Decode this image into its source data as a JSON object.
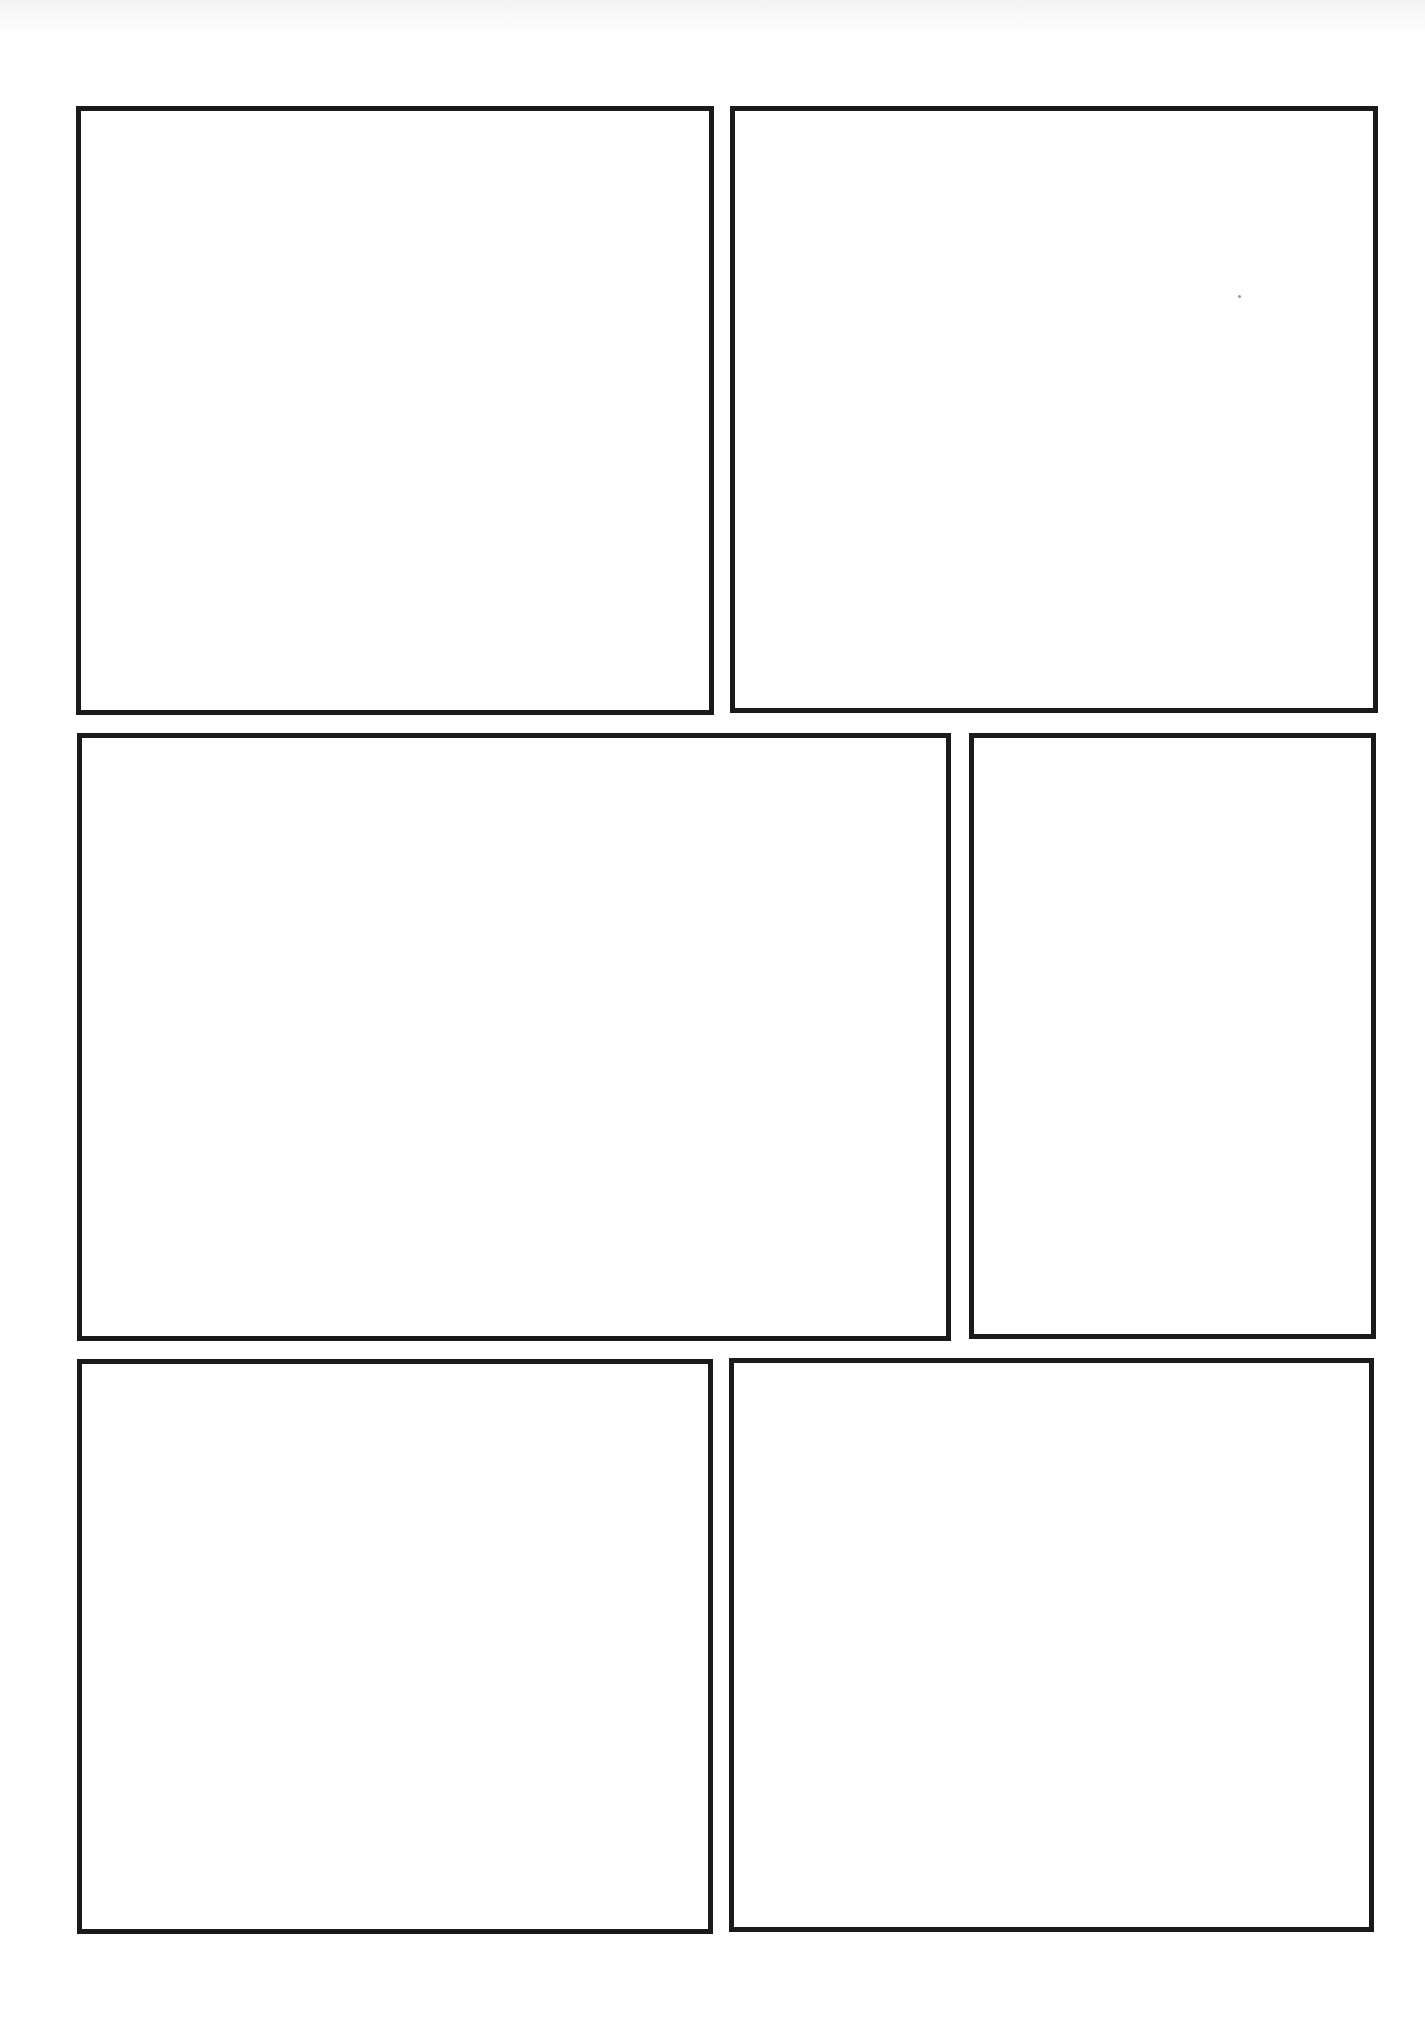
{
  "page": {
    "type": "comic-panel-template",
    "background_color": "#ffffff",
    "border_color": "#1a1a1a",
    "rows": 3
  },
  "panels": [
    {
      "id": 1,
      "row": 1,
      "position": "top-left",
      "x": 76,
      "y": 106,
      "width": 638,
      "height": 609
    },
    {
      "id": 2,
      "row": 1,
      "position": "top-right",
      "x": 730,
      "y": 106,
      "width": 648,
      "height": 607
    },
    {
      "id": 3,
      "row": 2,
      "position": "middle-left",
      "x": 77,
      "y": 733,
      "width": 874,
      "height": 608
    },
    {
      "id": 4,
      "row": 2,
      "position": "middle-right",
      "x": 969,
      "y": 733,
      "width": 407,
      "height": 606
    },
    {
      "id": 5,
      "row": 3,
      "position": "bottom-left",
      "x": 77,
      "y": 1359,
      "width": 636,
      "height": 575
    },
    {
      "id": 6,
      "row": 3,
      "position": "bottom-right",
      "x": 729,
      "y": 1358,
      "width": 645,
      "height": 574
    }
  ]
}
